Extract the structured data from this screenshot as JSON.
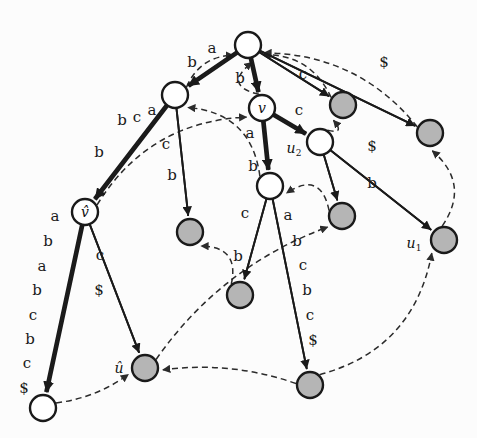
{
  "figure": {
    "colors": {
      "node_fill_white": "#ffffff",
      "node_fill_gray": "#b5b5b5",
      "node_stroke": "#1a1a1a",
      "edge_solid": "#1a1a1a",
      "edge_dashed": "#2b2b2b",
      "background": "#fcfcfc",
      "text": "#1a1a1a"
    },
    "node_radius": 13
  },
  "nodes": [
    {
      "id": "root",
      "x": 248,
      "y": 45,
      "fill": "white",
      "label": ""
    },
    {
      "id": "n_b",
      "x": 175,
      "y": 95,
      "fill": "white",
      "label": ""
    },
    {
      "id": "v",
      "x": 262,
      "y": 108,
      "fill": "white",
      "label": "v",
      "label_dx": 0,
      "label_dy": 0,
      "inside": true
    },
    {
      "id": "g_c",
      "x": 343,
      "y": 105,
      "fill": "gray",
      "label": ""
    },
    {
      "id": "g_top",
      "x": 430,
      "y": 133,
      "fill": "gray",
      "label": ""
    },
    {
      "id": "u2",
      "x": 320,
      "y": 142,
      "fill": "white",
      "label": "u",
      "sub": "2",
      "label_dx": -26,
      "label_dy": 7
    },
    {
      "id": "vhat",
      "x": 85,
      "y": 212,
      "fill": "white",
      "label": "v",
      "hat": true,
      "inside": true
    },
    {
      "id": "mid",
      "x": 270,
      "y": 186,
      "fill": "white",
      "label": ""
    },
    {
      "id": "g_l",
      "x": 190,
      "y": 232,
      "fill": "gray",
      "label": ""
    },
    {
      "id": "g_r",
      "x": 342,
      "y": 216,
      "fill": "gray",
      "label": ""
    },
    {
      "id": "u1",
      "x": 444,
      "y": 240,
      "fill": "gray",
      "label": "u",
      "sub": "1",
      "label_dx": -30,
      "label_dy": 4
    },
    {
      "id": "g_m",
      "x": 240,
      "y": 295,
      "fill": "gray",
      "label": ""
    },
    {
      "id": "uhat",
      "x": 145,
      "y": 368,
      "fill": "gray",
      "label": "u",
      "hat": true,
      "label_dx": -26,
      "label_dy": 0
    },
    {
      "id": "g_bc",
      "x": 310,
      "y": 385,
      "fill": "gray",
      "label": ""
    },
    {
      "id": "w_bl",
      "x": 43,
      "y": 408,
      "fill": "white",
      "label": ""
    }
  ],
  "edges": [
    {
      "from": "root",
      "to": "n_b",
      "type": "solid",
      "double": true,
      "labels": [
        "a"
      ]
    },
    {
      "from": "root",
      "to": "v",
      "type": "solid",
      "double": true,
      "labels": [
        "b"
      ]
    },
    {
      "from": "root",
      "to": "g_c",
      "type": "solid",
      "double": false,
      "labels": [
        "c"
      ]
    },
    {
      "from": "root",
      "to": "g_top",
      "type": "solid",
      "double": false,
      "labels": [
        "$"
      ]
    },
    {
      "from": "n_b",
      "to": "vhat",
      "type": "solid",
      "double": true,
      "labels": [
        "b",
        "c",
        "b",
        "a"
      ]
    },
    {
      "from": "n_b",
      "to": "g_l",
      "type": "solid",
      "double": false,
      "labels": [
        "c",
        "b"
      ]
    },
    {
      "from": "v",
      "to": "u2",
      "type": "solid",
      "double": true,
      "labels": [
        "c"
      ]
    },
    {
      "from": "v",
      "to": "mid",
      "type": "solid",
      "double": true,
      "labels": [
        "a",
        "b"
      ]
    },
    {
      "from": "u2",
      "to": "g_r",
      "type": "solid",
      "double": false,
      "labels": [
        "b"
      ]
    },
    {
      "from": "u2",
      "to": "u1",
      "type": "solid",
      "double": false,
      "labels": [
        "$"
      ]
    },
    {
      "from": "mid",
      "to": "g_m",
      "type": "solid",
      "double": false,
      "labels": [
        "c",
        "b"
      ]
    },
    {
      "from": "mid",
      "to": "g_bc",
      "type": "solid",
      "double": false,
      "labels": [
        "a",
        "b",
        "c",
        "b",
        "c",
        "$"
      ]
    },
    {
      "from": "vhat",
      "to": "w_bl",
      "type": "solid",
      "double": true,
      "labels": [
        "a",
        "b",
        "a",
        "b",
        "c",
        "b",
        "c",
        "$"
      ]
    },
    {
      "from": "vhat",
      "to": "uhat",
      "type": "solid",
      "double": false,
      "labels": [
        "c",
        "$"
      ]
    }
  ],
  "suffix_links": [
    {
      "from": "v",
      "to": "root",
      "type": "dashed"
    },
    {
      "from": "u2",
      "to": "g_c",
      "type": "dashed"
    },
    {
      "from": "g_c",
      "to": "root",
      "type": "dashed"
    },
    {
      "from": "g_top",
      "to": "root",
      "type": "dashed"
    },
    {
      "from": "vhat",
      "to": "v",
      "type": "dashed"
    },
    {
      "from": "n_b",
      "to": "root",
      "type": "dashed"
    },
    {
      "from": "mid",
      "to": "n_b",
      "type": "dashed"
    },
    {
      "from": "g_m",
      "to": "g_l",
      "type": "dashed"
    },
    {
      "from": "g_r",
      "to": "mid",
      "type": "dashed"
    },
    {
      "from": "u1",
      "to": "g_top",
      "type": "dashed"
    },
    {
      "from": "uhat",
      "to": "g_r",
      "type": "dashed"
    },
    {
      "from": "g_bc",
      "to": "uhat",
      "type": "dashed"
    },
    {
      "from": "w_bl",
      "to": "uhat",
      "type": "dashed"
    },
    {
      "from": "g_bc",
      "to": "u1",
      "type": "dashed"
    }
  ],
  "edge_labels": [
    {
      "text": "a",
      "x": 212,
      "y": 48
    },
    {
      "text": "b",
      "x": 192,
      "y": 62
    },
    {
      "text": "b",
      "x": 240,
      "y": 78
    },
    {
      "text": "c",
      "x": 303,
      "y": 74
    },
    {
      "text": "$",
      "x": 384,
      "y": 62
    },
    {
      "text": "c",
      "x": 137,
      "y": 117
    },
    {
      "text": "b",
      "x": 122,
      "y": 120
    },
    {
      "text": "a",
      "x": 152,
      "y": 110
    },
    {
      "text": "b",
      "x": 99,
      "y": 152
    },
    {
      "text": "c",
      "x": 166,
      "y": 144
    },
    {
      "text": "b",
      "x": 172,
      "y": 175
    },
    {
      "text": "c",
      "x": 299,
      "y": 110
    },
    {
      "text": "a",
      "x": 250,
      "y": 133
    },
    {
      "text": "b",
      "x": 253,
      "y": 166
    },
    {
      "text": "b",
      "x": 372,
      "y": 183
    },
    {
      "text": "$",
      "x": 372,
      "y": 146
    },
    {
      "text": "c",
      "x": 245,
      "y": 213
    },
    {
      "text": "b",
      "x": 238,
      "y": 256
    },
    {
      "text": "a",
      "x": 288,
      "y": 215
    },
    {
      "text": "b",
      "x": 297,
      "y": 241
    },
    {
      "text": "c",
      "x": 303,
      "y": 265
    },
    {
      "text": "b",
      "x": 307,
      "y": 290
    },
    {
      "text": "c",
      "x": 310,
      "y": 315
    },
    {
      "text": "$",
      "x": 313,
      "y": 340
    },
    {
      "text": "a",
      "x": 55,
      "y": 216
    },
    {
      "text": "b",
      "x": 48,
      "y": 241
    },
    {
      "text": "a",
      "x": 42,
      "y": 266
    },
    {
      "text": "b",
      "x": 37,
      "y": 290
    },
    {
      "text": "c",
      "x": 33,
      "y": 315
    },
    {
      "text": "b",
      "x": 30,
      "y": 339
    },
    {
      "text": "c",
      "x": 27,
      "y": 363
    },
    {
      "text": "$",
      "x": 24,
      "y": 388
    },
    {
      "text": "c",
      "x": 100,
      "y": 255
    },
    {
      "text": "$",
      "x": 99,
      "y": 290
    }
  ]
}
